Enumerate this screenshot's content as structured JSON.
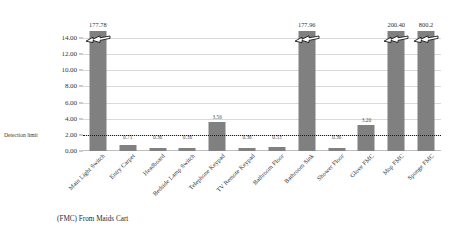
{
  "chart_data": {
    "type": "bar",
    "title": "",
    "subtitle": "",
    "caption": "(FMC) From Maids Cart",
    "xlabel": "",
    "ylabel": "",
    "ylim": [
      0,
      14
    ],
    "ytick_labels": [
      "0.00",
      "2.00",
      "4.00",
      "6.00",
      "8.00",
      "10.00",
      "12.00",
      "14.00"
    ],
    "ytick_values": [
      0,
      2,
      4,
      6,
      8,
      10,
      12,
      14
    ],
    "grid": true,
    "legend": "none",
    "annotations": [
      {
        "name": "detection-limit",
        "label": "Detection limit",
        "value": 2.0,
        "style": "dotted-line"
      }
    ],
    "categories": [
      "Main Light Switch",
      "Entry Carpet",
      "Headboard",
      "Bedside Lamp Switch",
      "Telephone Keypad",
      "TV Remote Keypad",
      "Bathroom Floor",
      "Bathroom Sink",
      "Shower Floor",
      "Glove FMC",
      "Mop FMC",
      "Sponge FMC"
    ],
    "values": [
      177.78,
      0.71,
      0.36,
      0.36,
      3.56,
      0.36,
      0.53,
      177.96,
      0.36,
      3.2,
      200.4,
      800.2
    ],
    "value_labels": [
      "177.78",
      "0.71",
      "0.36",
      "0.36",
      "3.56",
      "0.36",
      "0.53",
      "177.96",
      "0.36",
      "3.20",
      "200.40",
      "800.2"
    ],
    "truncated": [
      true,
      false,
      false,
      false,
      false,
      false,
      false,
      true,
      false,
      false,
      true,
      true
    ],
    "bar_color": "#808080",
    "grid_color": "#d9d9d9"
  }
}
